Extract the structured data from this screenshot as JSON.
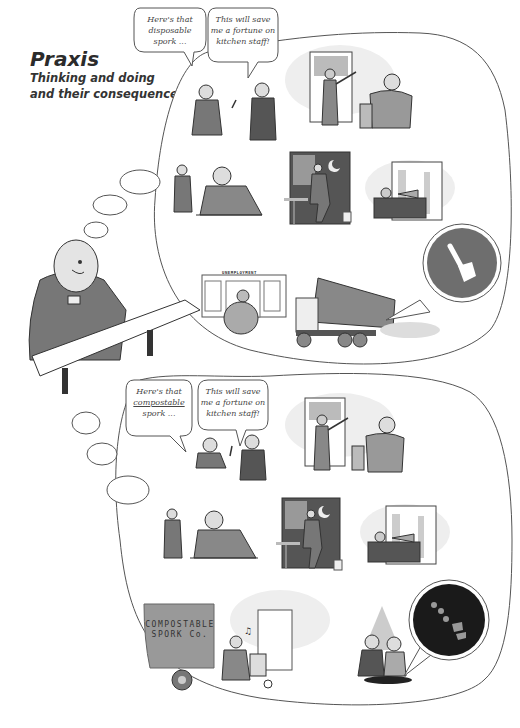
{
  "header": {
    "title": "Praxis",
    "subtitle_line1": "Thinking and doing",
    "subtitle_line2": "and their consequences"
  },
  "top_scenario": {
    "speech_left": [
      "Here's that",
      "disposable spork ..."
    ],
    "speech_right": [
      "This will save",
      "me a fortune on",
      "kitchen staff!"
    ],
    "panels": [
      {
        "name": "spork-sale",
        "description": "Salesman hands spork to restaurant owner"
      },
      {
        "name": "dishwasher-fired",
        "description": "Boss points dishwasher out the door"
      },
      {
        "name": "customer-complains",
        "description": "Diner laughing at flimsy spork"
      },
      {
        "name": "worker-leaves",
        "description": "Man walking out of bar at night"
      },
      {
        "name": "office-bonus",
        "description": "Executive relaxing at desk with piggy bank"
      },
      {
        "name": "unemployment-office",
        "description": "Overweight man at unemployment office",
        "sign": "UNEMPLOYMENT"
      },
      {
        "name": "landfill-dump",
        "description": "Dump truck unloading into landfill",
        "inset": "spork-icon"
      }
    ]
  },
  "bottom_scenario": {
    "speech_left": [
      "Here's that",
      "compostable",
      "spork ..."
    ],
    "speech_left_underlined": "compostable",
    "speech_right": [
      "This will save",
      "me a fortune on",
      "kitchen staff!"
    ],
    "panels": [
      {
        "name": "spork-sale",
        "description": "Salesman hands compostable spork to owner"
      },
      {
        "name": "dishwasher-fired",
        "description": "Boss points dishwasher out the door"
      },
      {
        "name": "customer-complains",
        "description": "Diner laughing"
      },
      {
        "name": "worker-leaves",
        "description": "Man walking out of bar at night"
      },
      {
        "name": "office-bonus",
        "description": "Executive relaxing at desk"
      },
      {
        "name": "delivery-job",
        "description": "Worker delivering boxes on hand truck",
        "truck_label_line1": "COMPOSTABLE",
        "truck_label_line2": "SPORK Co."
      },
      {
        "name": "garden-compost",
        "description": "Couple planting in garden",
        "inset": "decomposing-spork-icon"
      }
    ]
  },
  "colors": {
    "ink": "#2b2b2b",
    "grey_fill": "#8a8a8a",
    "light_grey": "#d8d8d8",
    "background": "#ffffff",
    "inset_top": "#6e6e6e",
    "inset_bottom": "#1a1a1a"
  }
}
